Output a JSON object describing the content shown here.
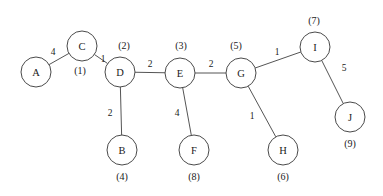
{
  "figure": {
    "type": "weighted-undirected-graph",
    "width": 383,
    "height": 196,
    "background_color": "#ffffff",
    "node_fill_color": "#ffffff",
    "node_stroke_color": "#4a4a4a",
    "edge_color": "#555555",
    "text_color": "#1a1a1a",
    "node_radius": 15
  },
  "nodes": [
    {
      "id": "A",
      "label": "A",
      "order": "",
      "cx": 36,
      "cy": 72,
      "order_x": 36,
      "order_y": 97
    },
    {
      "id": "C",
      "label": "C",
      "order": "(1)",
      "cx": 82,
      "cy": 46,
      "order_x": 80,
      "order_y": 70
    },
    {
      "id": "D",
      "label": "D",
      "order": "(2)",
      "cx": 120,
      "cy": 72,
      "order_x": 124,
      "order_y": 45
    },
    {
      "id": "B",
      "label": "B",
      "order": "(4)",
      "cx": 122,
      "cy": 150,
      "order_x": 122,
      "order_y": 176
    },
    {
      "id": "E",
      "label": "E",
      "order": "(3)",
      "cx": 180,
      "cy": 73,
      "order_x": 181,
      "order_y": 45
    },
    {
      "id": "F",
      "label": "F",
      "order": "(8)",
      "cx": 194,
      "cy": 150,
      "order_x": 194,
      "order_y": 176
    },
    {
      "id": "G",
      "label": "G",
      "order": "(5)",
      "cx": 241,
      "cy": 73,
      "order_x": 236,
      "order_y": 45
    },
    {
      "id": "H",
      "label": "H",
      "order": "(6)",
      "cx": 283,
      "cy": 150,
      "order_x": 283,
      "order_y": 176
    },
    {
      "id": "I",
      "label": "I",
      "order": "(7)",
      "cx": 315,
      "cy": 47,
      "order_x": 314,
      "order_y": 20
    },
    {
      "id": "J",
      "label": "J",
      "order": "(9)",
      "cx": 350,
      "cy": 117,
      "order_x": 350,
      "order_y": 143
    }
  ],
  "edges": [
    {
      "from": "A",
      "to": "C",
      "weight": "4",
      "label_x": 53,
      "label_y": 52
    },
    {
      "from": "C",
      "to": "D",
      "weight": "1",
      "label_x": 103,
      "label_y": 59
    },
    {
      "from": "D",
      "to": "B",
      "weight": "2",
      "label_x": 110,
      "label_y": 113
    },
    {
      "from": "D",
      "to": "E",
      "weight": "2",
      "label_x": 150,
      "label_y": 64
    },
    {
      "from": "E",
      "to": "F",
      "weight": "4",
      "label_x": 177,
      "label_y": 113
    },
    {
      "from": "E",
      "to": "G",
      "weight": "2",
      "label_x": 211,
      "label_y": 64
    },
    {
      "from": "G",
      "to": "H",
      "weight": "1",
      "label_x": 252,
      "label_y": 116
    },
    {
      "from": "G",
      "to": "I",
      "weight": "1",
      "label_x": 277,
      "label_y": 52
    },
    {
      "from": "I",
      "to": "J",
      "weight": "5",
      "label_x": 344,
      "label_y": 68
    }
  ],
  "chart_data": {
    "type": "graph",
    "title": "",
    "node_count": 10,
    "edge_count": 9,
    "node_ids": [
      "A",
      "B",
      "C",
      "D",
      "E",
      "F",
      "G",
      "H",
      "I",
      "J"
    ],
    "node_visit_order": {
      "C": 1,
      "D": 2,
      "E": 3,
      "B": 4,
      "G": 5,
      "H": 6,
      "I": 7,
      "F": 8,
      "J": 9
    },
    "edge_list": [
      [
        "A",
        "C",
        4
      ],
      [
        "C",
        "D",
        1
      ],
      [
        "D",
        "B",
        2
      ],
      [
        "D",
        "E",
        2
      ],
      [
        "E",
        "F",
        4
      ],
      [
        "E",
        "G",
        2
      ],
      [
        "G",
        "H",
        1
      ],
      [
        "G",
        "I",
        1
      ],
      [
        "I",
        "J",
        5
      ]
    ]
  }
}
